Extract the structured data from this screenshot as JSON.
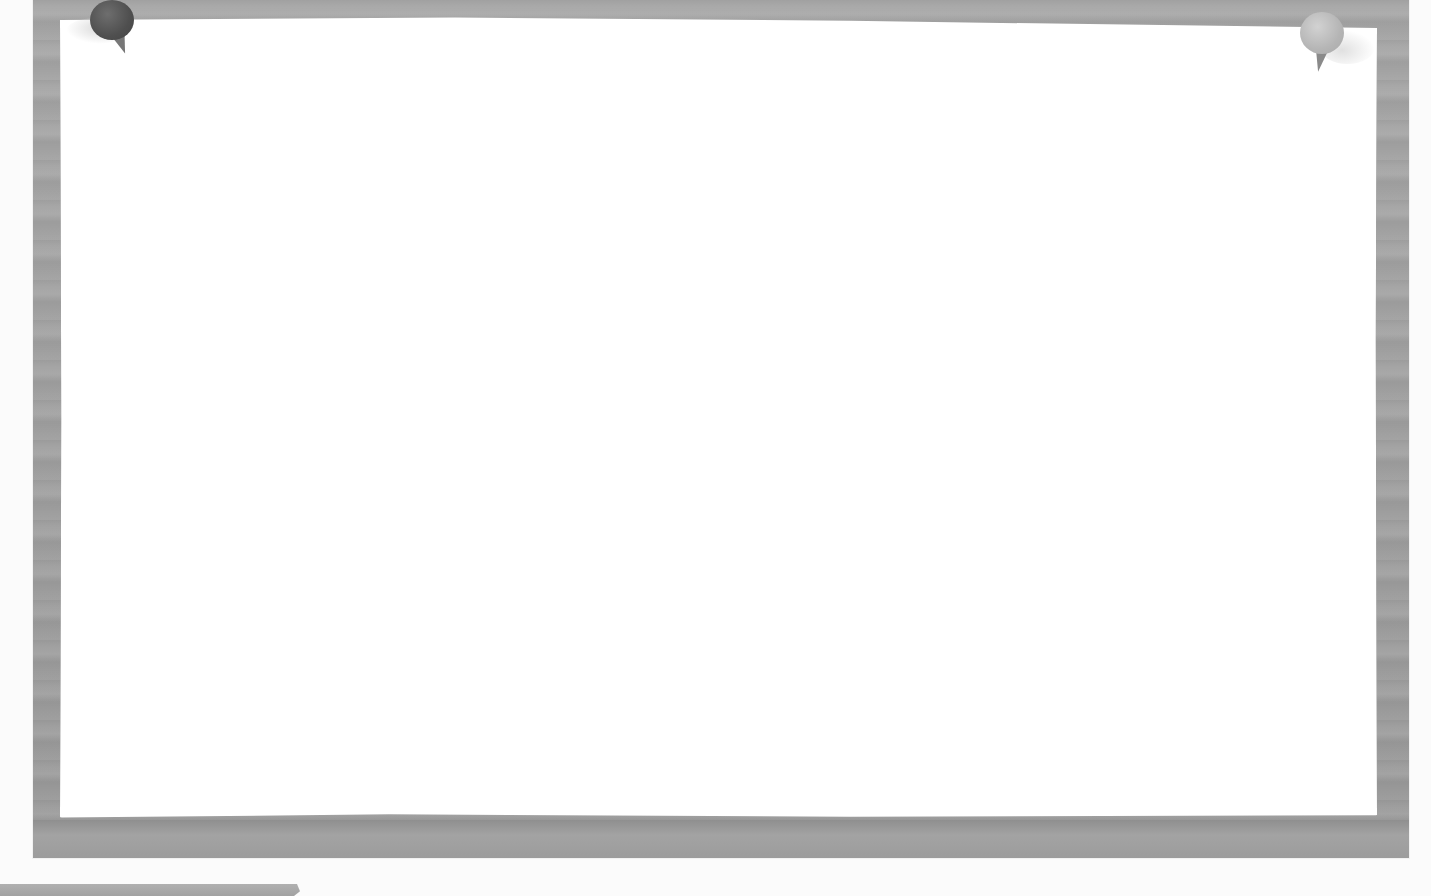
{
  "scene": {
    "description": "Corkboard-style wooden frame with a blank white sheet of paper pinned by two push pins",
    "board_color": "#a6a6a6",
    "paper_color": "#ffffff",
    "background_color": "#fbfbfb"
  },
  "pins": [
    {
      "position": "top-left",
      "color": "#555555"
    },
    {
      "position": "top-right",
      "color": "#bdbdbd"
    }
  ],
  "paper": {
    "text": ""
  }
}
